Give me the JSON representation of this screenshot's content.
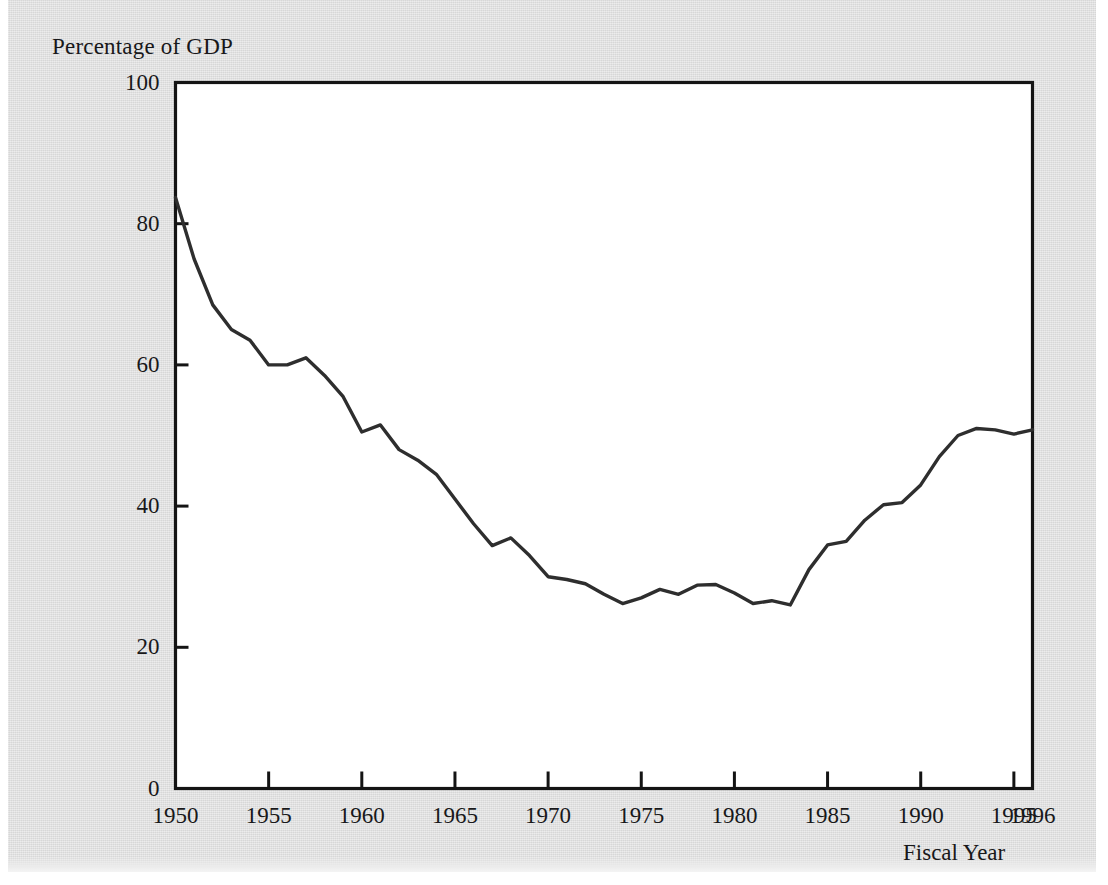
{
  "figure": {
    "axis_label_y": "Percentage of GDP",
    "axis_label_x": "Fiscal Year",
    "line_color": "#2e2e2e",
    "frame_color": "#141414",
    "paper_color": "#dcdcdc",
    "plot_background": "#ffffff"
  },
  "yticks": [
    {
      "value": 0,
      "label": "0"
    },
    {
      "value": 20,
      "label": "20"
    },
    {
      "value": 40,
      "label": "40"
    },
    {
      "value": 60,
      "label": "60"
    },
    {
      "value": 80,
      "label": "80"
    },
    {
      "value": 100,
      "label": "100"
    }
  ],
  "xticks": [
    {
      "value": 1950,
      "label": "1950"
    },
    {
      "value": 1955,
      "label": "1955"
    },
    {
      "value": 1960,
      "label": "1960"
    },
    {
      "value": 1965,
      "label": "1965"
    },
    {
      "value": 1970,
      "label": "1970"
    },
    {
      "value": 1975,
      "label": "1975"
    },
    {
      "value": 1980,
      "label": "1980"
    },
    {
      "value": 1985,
      "label": "1985"
    },
    {
      "value": 1990,
      "label": "1990"
    },
    {
      "value": 1995,
      "label": "1995"
    },
    {
      "value": 1996,
      "label": "1996"
    }
  ],
  "chart_data": {
    "type": "line",
    "title": "",
    "xlabel": "Fiscal Year",
    "ylabel": "Percentage of GDP",
    "xlim": [
      1950,
      1996
    ],
    "ylim": [
      0,
      100
    ],
    "grid": false,
    "legend": false,
    "series": [
      {
        "name": "Debt Held by the Public as a Percentage of GDP",
        "x": [
          1950,
          1951,
          1952,
          1953,
          1954,
          1955,
          1956,
          1957,
          1958,
          1959,
          1960,
          1961,
          1962,
          1963,
          1964,
          1965,
          1966,
          1967,
          1968,
          1969,
          1970,
          1971,
          1972,
          1973,
          1974,
          1975,
          1976,
          1977,
          1978,
          1979,
          1980,
          1981,
          1982,
          1983,
          1984,
          1985,
          1986,
          1987,
          1988,
          1989,
          1990,
          1991,
          1992,
          1993,
          1994,
          1995,
          1996
        ],
        "values": [
          83.7,
          75.0,
          68.5,
          65.0,
          63.5,
          60.0,
          60.0,
          61.0,
          58.5,
          55.5,
          50.5,
          51.5,
          48.0,
          46.5,
          44.5,
          41.0,
          37.5,
          34.4,
          35.5,
          33.0,
          30.0,
          29.6,
          29.0,
          27.5,
          26.2,
          27.0,
          28.2,
          27.5,
          28.8,
          28.9,
          27.7,
          26.2,
          26.6,
          26.0,
          31.0,
          34.5,
          35.0,
          38.0,
          40.2,
          40.5,
          43.0,
          47.0,
          50.0,
          51.0,
          50.8,
          50.2,
          50.8
        ]
      }
    ]
  }
}
